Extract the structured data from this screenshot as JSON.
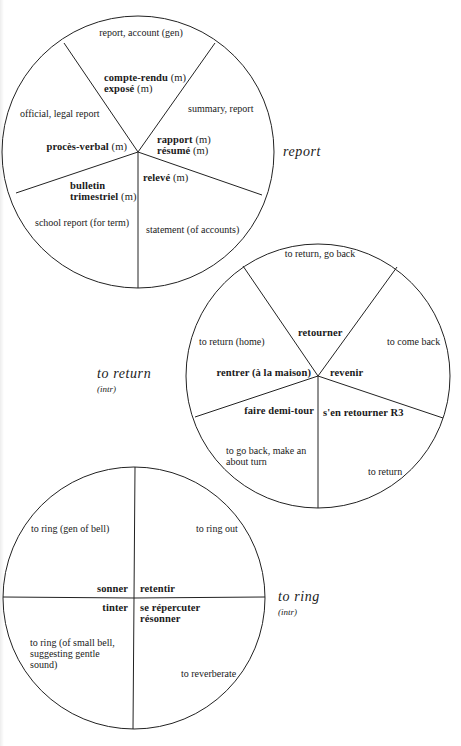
{
  "diagrams": [
    {
      "id": "report",
      "title": "report",
      "subtitle": "",
      "circle": {
        "cx": 138,
        "cy": 152,
        "r": 136
      },
      "spokes": [
        [
          64,
          43
        ],
        [
          215,
          43
        ],
        [
          262,
          195
        ],
        [
          138,
          288
        ],
        [
          16,
          193
        ]
      ],
      "segments": [
        {
          "gloss": "report, account (gen)",
          "terms": [
            {
              "word": "compte-rendu",
              "gender": "(m)"
            },
            {
              "word": "exposé",
              "gender": "(m)"
            }
          ]
        },
        {
          "gloss": "summary, report",
          "terms": [
            {
              "word": "rapport",
              "gender": "(m)"
            },
            {
              "word": "résumé",
              "gender": "(m)"
            }
          ]
        },
        {
          "gloss": "statement (of accounts)",
          "terms": [
            {
              "word": "relevé",
              "gender": "(m)"
            }
          ]
        },
        {
          "gloss": "school report (for term)",
          "terms": [
            {
              "word": "bulletin trimestriel",
              "gender": "(m)"
            }
          ]
        },
        {
          "gloss": "official, legal report",
          "terms": [
            {
              "word": "procès-verbal",
              "gender": "(m)"
            }
          ]
        }
      ]
    },
    {
      "id": "to-return",
      "title": "to return",
      "subtitle": "(intr)",
      "circle": {
        "cx": 318,
        "cy": 376,
        "r": 132
      },
      "spokes": [
        [
          243,
          266
        ],
        [
          397,
          267
        ],
        [
          443,
          418
        ],
        [
          318,
          508
        ],
        [
          195,
          417
        ]
      ],
      "segments": [
        {
          "gloss": "to return, go back",
          "terms": [
            {
              "word": "retourner",
              "gender": ""
            }
          ]
        },
        {
          "gloss": "to come back",
          "terms": [
            {
              "word": "revenir",
              "gender": ""
            }
          ]
        },
        {
          "gloss": "to return",
          "terms": [
            {
              "word": "s'en retourner R3",
              "gender": ""
            }
          ]
        },
        {
          "gloss": "to go back, make an about turn",
          "terms": [
            {
              "word": "faire demi-tour",
              "gender": ""
            }
          ]
        },
        {
          "gloss": "to return (home)",
          "terms": [
            {
              "word": "rentrer (à la maison)",
              "gender": ""
            }
          ]
        }
      ]
    },
    {
      "id": "to-ring",
      "title": "to ring",
      "subtitle": "(intr)",
      "circle": {
        "cx": 134,
        "cy": 598,
        "r": 131
      },
      "spokes": [
        [
          135,
          467
        ],
        [
          133,
          729
        ],
        [
          3,
          597
        ],
        [
          265,
          597
        ]
      ],
      "segments": [
        {
          "gloss": "to ring (gen of bell)",
          "terms": [
            {
              "word": "sonner",
              "gender": ""
            }
          ]
        },
        {
          "gloss": "to ring out",
          "terms": [
            {
              "word": "retentir",
              "gender": ""
            }
          ]
        },
        {
          "gloss": "to reverberate",
          "terms": [
            {
              "word": "se répercuter",
              "gender": ""
            },
            {
              "word": "résonner",
              "gender": ""
            }
          ]
        },
        {
          "gloss": "to ring (of small bell, suggesting gentle sound)",
          "terms": [
            {
              "word": "tinter",
              "gender": ""
            }
          ]
        }
      ]
    }
  ],
  "labels": {
    "report": {
      "title": "report",
      "gloss_top": "report, account (gen)",
      "compte_rendu": "compte-rendu",
      "expose": "exposé",
      "m": "(m)",
      "gloss_summary": "summary, report",
      "gloss_official": "official, legal report",
      "proces_verbal": "procès-verbal",
      "rapport": "rapport",
      "resume": "résumé",
      "releve": "relevé",
      "bulletin": "bulletin",
      "trimestriel": "trimestriel",
      "gloss_school": "school report (for term)",
      "gloss_statement": "statement (of accounts)"
    },
    "return": {
      "title": "to return",
      "subtitle": "(intr)",
      "gloss_top": "to return, go back",
      "retourner": "retourner",
      "gloss_home": "to return (home)",
      "gloss_come_back": "to come back",
      "rentrer": "rentrer (à la maison)",
      "revenir": "revenir",
      "demi_tour": "faire demi-tour",
      "sen_retourner": "s'en retourner R3",
      "gloss_go_back_1": "to go back, make an",
      "gloss_go_back_2": "about turn",
      "gloss_return": "to return"
    },
    "ring": {
      "title": "to ring",
      "subtitle": "(intr)",
      "gloss_gen": "to ring (gen of bell)",
      "gloss_out": "to ring out",
      "sonner": "sonner",
      "retentir": "retentir",
      "tinter": "tinter",
      "repercuter": "se répercuter",
      "resonner": "résonner",
      "gloss_small_1": "to ring (of small bell,",
      "gloss_small_2": "suggesting gentle",
      "gloss_small_3": "sound)",
      "gloss_reverberate": "to reverberate"
    }
  }
}
